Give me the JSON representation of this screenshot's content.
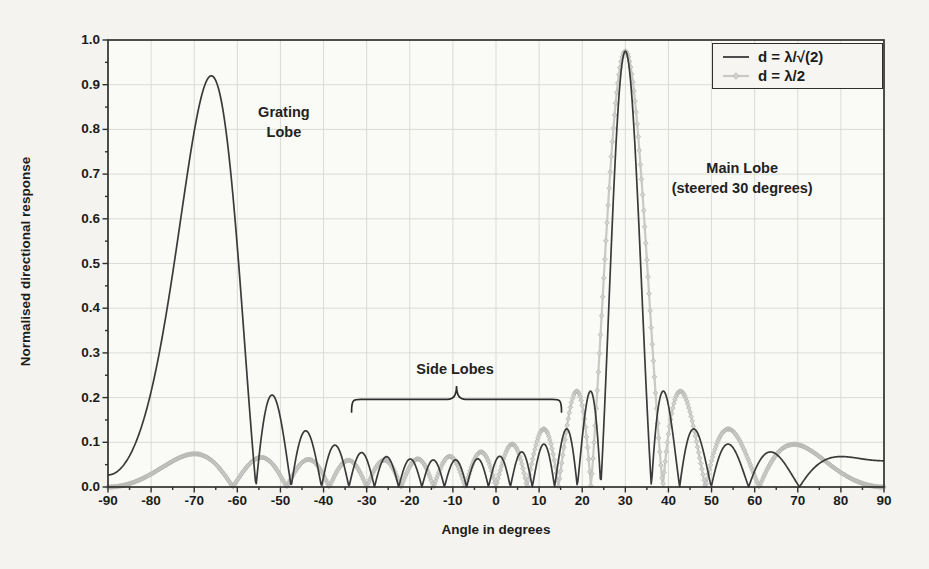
{
  "figure": {
    "kind": "scanned textbook line chart of array directional response",
    "title": ""
  },
  "chart_data": {
    "type": "line",
    "title": "",
    "xlabel": "Angle in degrees",
    "ylabel": "Normalised directional response",
    "xlim": [
      -90,
      90
    ],
    "ylim": [
      0.0,
      1.0
    ],
    "x_major_ticks": [
      -90,
      -80,
      -70,
      -60,
      -50,
      -40,
      -30,
      -20,
      -10,
      0,
      10,
      20,
      30,
      40,
      50,
      60,
      70,
      80,
      90
    ],
    "x_minor_step_deg": 5,
    "y_major_ticks": [
      0.0,
      0.1,
      0.2,
      0.3,
      0.4,
      0.5,
      0.6,
      0.7,
      0.8,
      0.9,
      1.0
    ],
    "y_minor_step": 0.05,
    "grid": "major gridlines both axes",
    "legend_position": "top-right",
    "sample_step_deg": 0.2,
    "envelope": {
      "peak": 0.975,
      "droop": 0.055,
      "center_deg": 30,
      "scale_deg": 96
    },
    "series": [
      {
        "name": "d = λ/√(2)",
        "color": "#3a3a3a",
        "line_width": 1.7,
        "marker": "none",
        "model": {
          "kind": "uniform-linear-array",
          "n_elements": 16,
          "d_over_lambda": 0.70711,
          "steer_deg": 30
        }
      },
      {
        "name": "d = λ/2",
        "color": "#c8c8c5",
        "line_width": 2.2,
        "marker": "diamond",
        "marker_step_deg": 0.25,
        "marker_size": 2.4,
        "marker_fill": "#d2d2cf",
        "marker_edge": "#b4b4b1",
        "model": {
          "kind": "uniform-linear-array",
          "n_elements": 16,
          "d_over_lambda": 0.5,
          "steer_deg": 30
        }
      }
    ],
    "annotations": [
      {
        "id": "grating-lobe",
        "lines": [
          "Grating",
          "Lobe"
        ],
        "x_deg": -49.2,
        "y_val": 0.862
      },
      {
        "id": "main-lobe",
        "lines": [
          "Main Lobe",
          "(steered 30 degrees)"
        ],
        "x_deg": 57.1,
        "y_val": 0.736
      },
      {
        "id": "side-lobes",
        "lines": [
          "Side Lobes"
        ],
        "x_deg": -9.5,
        "y_val": 0.287,
        "brace": {
          "x1_deg": -33.5,
          "x2_deg": 15.2,
          "y_base": 0.168,
          "y_line": 0.196,
          "y_tip": 0.226
        }
      }
    ],
    "key_features": {
      "main_lobe": {
        "angle_deg": 30,
        "peak_value": 0.97,
        "series": "both curves"
      },
      "grating_lobe": {
        "angle_deg": -66,
        "peak_value": 0.92,
        "series": "d = λ/√(2) only"
      },
      "first_side_lobe_level": 0.21,
      "black_first_side_lobes_deg": [
        21.6,
        39.2,
        -51.8
      ],
      "gray_first_side_lobes_deg": [
        18.2,
        43.4
      ],
      "side_lobe_region_deg": [
        -33,
        15
      ],
      "black_curve_at_minus90": 0.03,
      "black_shelf_75_to_90": 0.06,
      "gray_broad_lobes_left_deg": [
        -69.6,
        -54.0
      ],
      "gray_broad_lobes_left_level": 0.07
    },
    "colors": {
      "background": "#f4f3ef",
      "plot_background": "#fafaf7",
      "grid": "#dadad5",
      "axis": "#2f2f2f",
      "text": "#1c1c1c",
      "series_black": "#3a3a3a",
      "series_gray": "#c8c8c5"
    }
  }
}
